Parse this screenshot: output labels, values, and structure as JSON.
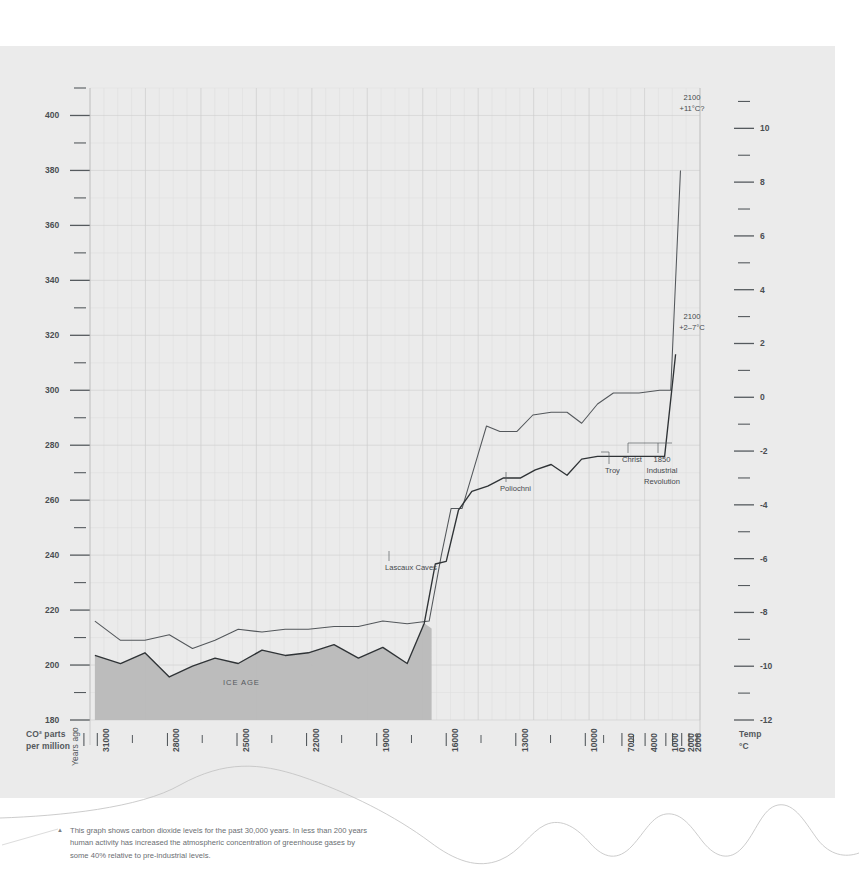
{
  "figure": {
    "background_color": "#ebebeb",
    "page_color": "#ffffff",
    "ice_age_label": "ICE AGE",
    "caption_marker": "▲",
    "caption": "This graph shows carbon dioxide levels for the past 30,000 years. In less than 200 years human activity has increased the atmospheric concentration of greenhouse gases by some 40% relative to pre-industrial levels."
  },
  "axes": {
    "left_title_line1": "CO² parts",
    "left_title_line2": "per million",
    "right_title_line1": "Temp",
    "right_title_line2": "°C",
    "x_title": "Years ago"
  },
  "annotations": {
    "lascaux": "Lascaux Caves",
    "poliochni": "Poliochni",
    "troy": "Troy",
    "christ": "Christ",
    "industrial_year": "1850",
    "industrial_line1": "Industrial",
    "industrial_line2": "Revolution",
    "proj_high_year": "2100",
    "proj_high_value": "+11°C?",
    "proj_low_year": "2100",
    "proj_low_value": "+2–7°C"
  },
  "chart_data": {
    "type": "line",
    "title": "",
    "xlabel": "Years ago",
    "ylabel": "CO² parts per million",
    "y2label": "Temp °C",
    "grid": true,
    "legend": "none",
    "ylim": [
      180,
      410
    ],
    "y2lim": [
      -12,
      11.5
    ],
    "yticks_major": [
      180,
      200,
      220,
      240,
      260,
      280,
      300,
      320,
      340,
      360,
      380,
      400
    ],
    "yticks_minor": [
      190,
      210,
      230,
      250,
      270,
      290,
      310,
      330,
      350,
      370,
      390,
      410
    ],
    "y2ticks_major": [
      -12,
      -10,
      -8,
      -6,
      -4,
      -2,
      0,
      2,
      4,
      6,
      8,
      10
    ],
    "y2ticks_minor": [
      -11,
      -9,
      -7,
      -5,
      -3,
      -1,
      1,
      3,
      5,
      7,
      9,
      11
    ],
    "xticks_labeled": [
      "31000",
      "28000",
      "25000",
      "22000",
      "19000",
      "16000",
      "13000",
      "10000",
      "7000",
      "4000",
      "1000",
      "0",
      "2000",
      "2006"
    ],
    "xtick_positions": [
      0.012,
      0.127,
      0.241,
      0.355,
      0.47,
      0.584,
      0.698,
      0.812,
      0.872,
      0.91,
      0.944,
      0.955,
      0.97,
      0.982
    ],
    "ice_age_span": [
      "31000",
      "16500"
    ],
    "series": [
      {
        "name": "CO² concentration (ppm)",
        "axis": "left",
        "color": "#53575b",
        "points": [
          {
            "x": 0.008,
            "co2": 216
          },
          {
            "x": 0.05,
            "co2": 209
          },
          {
            "x": 0.09,
            "co2": 209
          },
          {
            "x": 0.13,
            "co2": 211
          },
          {
            "x": 0.168,
            "co2": 206
          },
          {
            "x": 0.205,
            "co2": 209
          },
          {
            "x": 0.243,
            "co2": 213
          },
          {
            "x": 0.282,
            "co2": 212
          },
          {
            "x": 0.32,
            "co2": 213
          },
          {
            "x": 0.358,
            "co2": 213
          },
          {
            "x": 0.4,
            "co2": 214
          },
          {
            "x": 0.44,
            "co2": 214
          },
          {
            "x": 0.48,
            "co2": 216
          },
          {
            "x": 0.52,
            "co2": 215
          },
          {
            "x": 0.556,
            "co2": 216
          },
          {
            "x": 0.576,
            "co2": 240
          },
          {
            "x": 0.592,
            "co2": 257
          },
          {
            "x": 0.61,
            "co2": 257
          },
          {
            "x": 0.63,
            "co2": 272
          },
          {
            "x": 0.65,
            "co2": 287
          },
          {
            "x": 0.672,
            "co2": 285
          },
          {
            "x": 0.7,
            "co2": 285
          },
          {
            "x": 0.726,
            "co2": 291
          },
          {
            "x": 0.756,
            "co2": 292
          },
          {
            "x": 0.782,
            "co2": 292
          },
          {
            "x": 0.806,
            "co2": 288
          },
          {
            "x": 0.832,
            "co2": 295
          },
          {
            "x": 0.858,
            "co2": 299
          },
          {
            "x": 0.9,
            "co2": 299
          },
          {
            "x": 0.934,
            "co2": 300
          },
          {
            "x": 0.952,
            "co2": 300
          },
          {
            "x": 0.968,
            "co2": 380
          }
        ]
      },
      {
        "name": "Temperature anomaly (°C)",
        "axis": "right",
        "color": "#2f3336",
        "points": [
          {
            "x": 0.008,
            "temp": -9.6
          },
          {
            "x": 0.05,
            "temp": -9.9
          },
          {
            "x": 0.09,
            "temp": -9.5
          },
          {
            "x": 0.13,
            "temp": -10.4
          },
          {
            "x": 0.168,
            "temp": -10.0
          },
          {
            "x": 0.205,
            "temp": -9.7
          },
          {
            "x": 0.243,
            "temp": -9.9
          },
          {
            "x": 0.282,
            "temp": -9.4
          },
          {
            "x": 0.32,
            "temp": -9.6
          },
          {
            "x": 0.358,
            "temp": -9.5
          },
          {
            "x": 0.4,
            "temp": -9.2
          },
          {
            "x": 0.44,
            "temp": -9.7
          },
          {
            "x": 0.48,
            "temp": -9.3
          },
          {
            "x": 0.52,
            "temp": -9.9
          },
          {
            "x": 0.548,
            "temp": -8.4
          },
          {
            "x": 0.566,
            "temp": -6.2
          },
          {
            "x": 0.584,
            "temp": -6.1
          },
          {
            "x": 0.604,
            "temp": -4.2
          },
          {
            "x": 0.626,
            "temp": -3.5
          },
          {
            "x": 0.652,
            "temp": -3.3
          },
          {
            "x": 0.678,
            "temp": -3.0
          },
          {
            "x": 0.706,
            "temp": -3.0
          },
          {
            "x": 0.73,
            "temp": -2.7
          },
          {
            "x": 0.756,
            "temp": -2.5
          },
          {
            "x": 0.782,
            "temp": -2.9
          },
          {
            "x": 0.806,
            "temp": -2.3
          },
          {
            "x": 0.832,
            "temp": -2.2
          },
          {
            "x": 0.88,
            "temp": -2.2
          },
          {
            "x": 0.942,
            "temp": -2.2
          },
          {
            "x": 0.96,
            "temp": 1.6
          }
        ]
      }
    ]
  }
}
